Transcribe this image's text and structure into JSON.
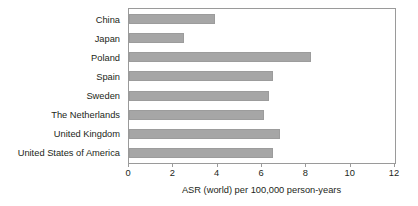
{
  "chart_data": {
    "type": "bar",
    "orientation": "horizontal",
    "title": "",
    "subtitle": "",
    "xlabel": "ASR (world) per 100,000 person-years",
    "ylabel": "",
    "categories": [
      "China",
      "Japan",
      "Poland",
      "Spain",
      "Sweden",
      "The Netherlands",
      "United Kingdom",
      "United States of America"
    ],
    "values": [
      3.9,
      2.5,
      8.2,
      6.5,
      6.3,
      6.1,
      6.8,
      6.5
    ],
    "xlim": [
      0,
      12
    ],
    "xticks": [
      0,
      2,
      4,
      6,
      8,
      10,
      12
    ],
    "xtick_labels": [
      "0",
      "2",
      "4",
      "6",
      "8",
      "10",
      "12"
    ],
    "grid": false,
    "legend": null,
    "legend_position": "none",
    "bar_color": "#a6a6a6",
    "axis_color": "#9a9a9a",
    "background_color": "#ffffff"
  }
}
